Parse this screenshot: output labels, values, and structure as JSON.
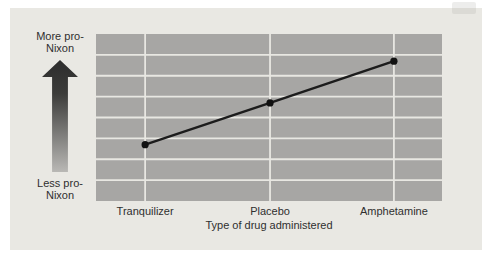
{
  "chart_data": {
    "type": "line",
    "title": "",
    "categories": [
      "Tranquilizer",
      "Placebo",
      "Amphetamine"
    ],
    "values": [
      2.7,
      4.7,
      6.7
    ],
    "ylim": [
      0,
      8
    ],
    "xlabel": "Type of drug administered",
    "ylabel_qualitative": {
      "high": "More pro-Nixon",
      "low": "Less pro-Nixon"
    },
    "grid": {
      "horizontal_rows": 8,
      "vertical_lines": "at category positions",
      "gridlines_on": true
    },
    "category_x_fractions": [
      0.142,
      0.503,
      0.861
    ],
    "legend": null,
    "series_count": 1
  },
  "colors": {
    "figure_background": "#e9e8e3",
    "panel": "#a7a6a4",
    "gridline": "#e8e7e2",
    "data_line": "#1c1c1c",
    "marker": "#111111",
    "text": "#2f2f2f",
    "arrow_gradient_top": "#2d2d2d",
    "arrow_gradient_bottom": "#b9b8b5"
  }
}
